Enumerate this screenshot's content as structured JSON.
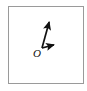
{
  "figure": {
    "kind": "vector-diagram",
    "background_color": "#ffffff",
    "frame": {
      "border_color": "#9a9a9a",
      "border_width_px": 1,
      "x": 8,
      "y": 6,
      "width": 76,
      "height": 78
    },
    "origin": {
      "label": "O",
      "style": "italic-serif",
      "label_x": 33,
      "label_y": 47,
      "point_x": 42,
      "point_y": 48,
      "color": "#111111"
    },
    "vectors": [
      {
        "name": "vector-up",
        "label": "",
        "from_x": 42,
        "from_y": 48,
        "to_x": 50,
        "to_y": 19,
        "color": "#111111",
        "stroke_width": 1.7,
        "arrowhead": "solid-filled"
      },
      {
        "name": "vector-right",
        "label": "",
        "from_x": 42,
        "from_y": 48,
        "to_x": 57,
        "to_y": 44,
        "color": "#111111",
        "stroke_width": 1.7,
        "arrowhead": "solid-filled"
      }
    ]
  }
}
